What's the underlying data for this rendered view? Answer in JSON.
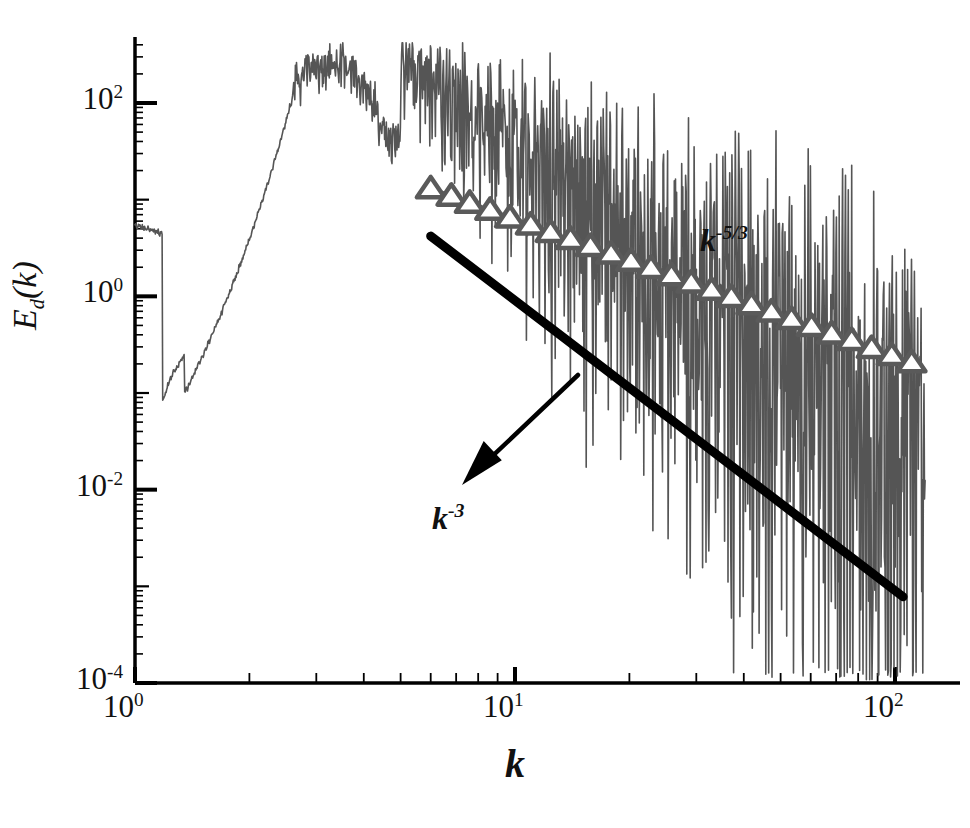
{
  "chart_data": {
    "type": "line",
    "title": "",
    "xlabel": "k",
    "ylabel": "E_d(k)",
    "xscale": "log",
    "yscale": "log",
    "xlim": [
      1,
      130
    ],
    "ylim": [
      0.0001,
      500
    ],
    "grid": false,
    "legend": "none",
    "xticks": [
      {
        "value": 1,
        "label_mantissa": "10",
        "label_exp": "0"
      },
      {
        "value": 10,
        "label_mantissa": "10",
        "label_exp": "1"
      },
      {
        "value": 100,
        "label_mantissa": "10",
        "label_exp": "2"
      }
    ],
    "yticks": [
      {
        "value": 100,
        "label_mantissa": "10",
        "label_exp": "2"
      },
      {
        "value": 1,
        "label_mantissa": "10",
        "label_exp": "0"
      },
      {
        "value": 0.01,
        "label_mantissa": "10",
        "label_exp": "-2"
      },
      {
        "value": 0.0001,
        "label_mantissa": "10",
        "label_exp": "-4"
      }
    ],
    "annotations": [
      {
        "name": "k-minus-five-thirds-label",
        "base": "k",
        "exp": "-5/3",
        "x_px": 700,
        "y_px": 222
      },
      {
        "name": "k-minus-three-label",
        "base": "k",
        "exp": "-3",
        "x_px": 432,
        "y_px": 500
      }
    ],
    "series": [
      {
        "name": "spectrum",
        "style": "solid",
        "color": "#555555",
        "width": 1.6,
        "description": "noisy turbulent energy spectrum E_d(k), broad peak near k=3-5 at E~300, decaying with increasing oscillation amplitude to ~1e-4 near k=100"
      },
      {
        "name": "k^-5/3 reference",
        "style": "dashdot-with-open-triangle-markers",
        "color": "#5a5a5a",
        "width": 4,
        "marker": "open-triangle-up",
        "x": [
          6.0,
          6.8,
          7.6,
          8.6,
          9.7,
          11.0,
          12.4,
          14.0,
          15.8,
          17.9,
          20.2,
          22.8,
          25.8,
          29.1,
          32.9,
          37.1,
          41.9,
          47.3,
          53.4,
          60.3,
          68.1,
          76.9,
          86.8,
          98.0,
          110.6
        ],
        "y": [
          13.0,
          10.9,
          9.2,
          7.8,
          6.5,
          5.5,
          4.6,
          3.9,
          3.3,
          2.75,
          2.32,
          1.95,
          1.64,
          1.38,
          1.16,
          0.98,
          0.82,
          0.69,
          0.58,
          0.49,
          0.41,
          0.35,
          0.29,
          0.245,
          0.206
        ]
      },
      {
        "name": "k^-3 reference",
        "style": "solid-thick",
        "color": "#000000",
        "width": 9,
        "x_start": 6.0,
        "y_start": 4.2,
        "x_end": 105.0,
        "y_end": 0.00078
      }
    ],
    "arrow": {
      "name": "k-minus-three-pointer",
      "from_x_px": 578,
      "from_y_px": 375,
      "to_x_px": 462,
      "to_y_px": 485,
      "color": "#000000"
    },
    "axis": {
      "color": "#000000",
      "left_px": 135,
      "bottom_px": 683,
      "top_px": 37,
      "right_px": 960,
      "minor_ticks": true
    }
  }
}
